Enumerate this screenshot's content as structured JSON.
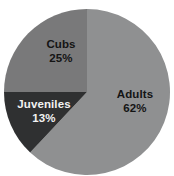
{
  "chart_data": {
    "type": "pie",
    "title": "",
    "categories": [
      "Adults",
      "Juveniles",
      "Cubs"
    ],
    "values": [
      62,
      13,
      25
    ],
    "unit": "%",
    "legend": "none",
    "labels_inside": true,
    "slices": [
      {
        "name": "Adults",
        "value": 62,
        "label": "Adults",
        "value_label": "62%",
        "color": "#8f9091",
        "text_color": "#141414",
        "start_angle_deg": 0,
        "end_angle_deg": 223.2
      },
      {
        "name": "Juveniles",
        "value": 13,
        "label": "Juveniles",
        "value_label": "13%",
        "color": "#2f3031",
        "text_color": "#f2f2f2",
        "start_angle_deg": 223.2,
        "end_angle_deg": 270.0
      },
      {
        "name": "Cubs",
        "value": 25,
        "label": "Cubs",
        "value_label": "25%",
        "color": "#79797a",
        "text_color": "#141414",
        "start_angle_deg": 270.0,
        "end_angle_deg": 360.0
      }
    ],
    "background_color": "#ffffff",
    "center_x": 87,
    "center_y": 92,
    "radius": 83
  }
}
